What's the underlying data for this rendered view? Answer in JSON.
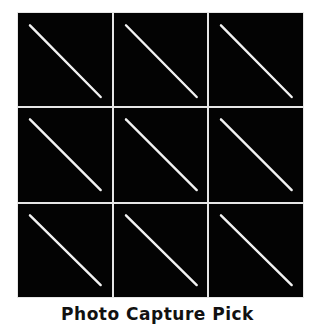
{
  "grid": {
    "rows": 3,
    "cols": 3,
    "cell_background": "#030303",
    "line_color": "#f2f2f2",
    "cells": [
      {
        "row": 1,
        "col": 1,
        "icon": "diagonal-line"
      },
      {
        "row": 1,
        "col": 2,
        "icon": "diagonal-line"
      },
      {
        "row": 1,
        "col": 3,
        "icon": "diagonal-line"
      },
      {
        "row": 2,
        "col": 1,
        "icon": "diagonal-line"
      },
      {
        "row": 2,
        "col": 2,
        "icon": "diagonal-line"
      },
      {
        "row": 2,
        "col": 3,
        "icon": "diagonal-line"
      },
      {
        "row": 3,
        "col": 1,
        "icon": "diagonal-line"
      },
      {
        "row": 3,
        "col": 2,
        "icon": "diagonal-line"
      },
      {
        "row": 3,
        "col": 3,
        "icon": "diagonal-line"
      }
    ]
  },
  "caption": "Photo Capture Pick"
}
